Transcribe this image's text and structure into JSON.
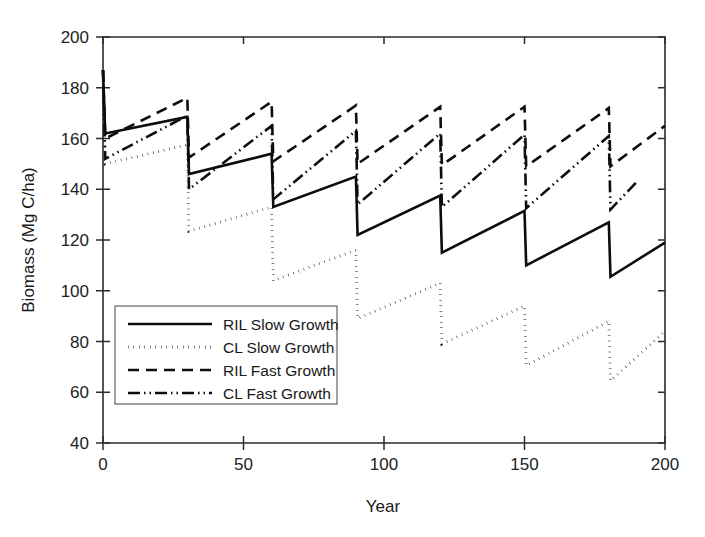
{
  "chart_data": {
    "type": "line",
    "title": "",
    "xlabel": "Year",
    "ylabel": "Biomass (Mg C/ha)",
    "xlim": [
      0,
      200
    ],
    "ylim": [
      40,
      200
    ],
    "xticks": [
      0,
      50,
      100,
      150,
      200
    ],
    "yticks": [
      40,
      60,
      80,
      100,
      120,
      140,
      160,
      180,
      200
    ],
    "xtick_labels": [
      "0",
      "50",
      "100",
      "150",
      "200"
    ],
    "ytick_labels": [
      "40",
      "60",
      "80",
      "100",
      "120",
      "140",
      "160",
      "180",
      "200"
    ],
    "grid": false,
    "legend_position": "lower-left-inside",
    "harvest_interval_years": 30,
    "series": [
      {
        "name": "RIL Slow Growth",
        "style": "solid",
        "color": "#0d0d0d",
        "width": 2.6,
        "dasharray": "none",
        "points": [
          [
            0,
            187
          ],
          [
            0.8,
            162
          ],
          [
            30,
            168.5
          ],
          [
            30.6,
            146
          ],
          [
            60,
            154
          ],
          [
            60.6,
            133
          ],
          [
            90,
            145
          ],
          [
            90.6,
            122
          ],
          [
            120,
            137.5
          ],
          [
            120.6,
            115
          ],
          [
            150,
            131.5
          ],
          [
            150.6,
            110
          ],
          [
            180,
            127
          ],
          [
            180.6,
            105.5
          ],
          [
            200,
            119
          ]
        ]
      },
      {
        "name": "CL Slow Growth",
        "style": "dotted",
        "color": "#0d0d0d",
        "width": 2.8,
        "dasharray": "0.5,5",
        "points": [
          [
            0,
            187
          ],
          [
            0.8,
            150
          ],
          [
            30,
            157.5
          ],
          [
            30.6,
            123.5
          ],
          [
            60,
            133
          ],
          [
            60.6,
            104
          ],
          [
            90,
            116
          ],
          [
            90.6,
            89
          ],
          [
            120,
            103
          ],
          [
            120.6,
            79
          ],
          [
            150,
            94
          ],
          [
            150.6,
            70.5
          ],
          [
            180,
            88
          ],
          [
            180.6,
            64.5
          ],
          [
            200,
            84
          ]
        ]
      },
      {
        "name": "RIL Fast Growth",
        "style": "dashed",
        "color": "#0d0d0d",
        "width": 2.6,
        "dasharray": "11,7",
        "points": [
          [
            0,
            187
          ],
          [
            0.8,
            160
          ],
          [
            30,
            176
          ],
          [
            30.6,
            152.5
          ],
          [
            60,
            174.5
          ],
          [
            60.6,
            151
          ],
          [
            90,
            173
          ],
          [
            90.6,
            150
          ],
          [
            120,
            172.5
          ],
          [
            120.6,
            149.5
          ],
          [
            150,
            172.5
          ],
          [
            150.6,
            149
          ],
          [
            180,
            172
          ],
          [
            180.6,
            149
          ],
          [
            200,
            165
          ]
        ]
      },
      {
        "name": "CL Fast Growth",
        "style": "dash-dot-dot",
        "color": "#0d0d0d",
        "width": 2.6,
        "dasharray": "12,4,1.5,4,1.5,4",
        "points": [
          [
            0,
            187
          ],
          [
            0.8,
            152
          ],
          [
            30,
            169
          ],
          [
            30.6,
            140
          ],
          [
            60,
            165
          ],
          [
            60.6,
            136
          ],
          [
            90,
            163
          ],
          [
            90.6,
            134
          ],
          [
            120,
            162
          ],
          [
            120.6,
            133
          ],
          [
            150,
            161.5
          ],
          [
            150.6,
            132.5
          ],
          [
            180,
            161
          ],
          [
            180.6,
            132
          ],
          [
            190,
            143
          ]
        ]
      }
    ],
    "legend_entries": [
      "RIL Slow Growth",
      "CL Slow Growth",
      "RIL Fast Growth",
      "CL Fast Growth"
    ]
  },
  "figure": {
    "background_color": "#ffffff",
    "axis_color": "#2b2b2b",
    "line_color": "#0d0d0d"
  }
}
